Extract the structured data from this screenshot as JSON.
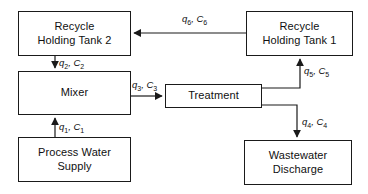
{
  "diagram": {
    "type": "block-flow-diagram",
    "colors": {
      "stroke": "#1a1a1a",
      "text": "#101010",
      "background": "#ffffff"
    },
    "nodes": [
      {
        "id": "recycle-holding-tank-2",
        "label": "Recycle\nHolding Tank 2",
        "x": 18,
        "y": 11,
        "w": 113,
        "h": 45
      },
      {
        "id": "recycle-holding-tank-1",
        "label": "Recycle\nHolding Tank 1",
        "x": 246,
        "y": 11,
        "w": 107,
        "h": 45
      },
      {
        "id": "mixer",
        "label": "Mixer",
        "x": 18,
        "y": 71,
        "w": 113,
        "h": 44
      },
      {
        "id": "treatment",
        "label": "Treatment",
        "x": 165,
        "y": 84,
        "w": 97,
        "h": 24
      },
      {
        "id": "process-water-supply",
        "label": "Process Water\nSupply",
        "x": 18,
        "y": 137,
        "w": 113,
        "h": 45
      },
      {
        "id": "wastewater-discharge",
        "label": "Wastewater\nDischarge",
        "x": 244,
        "y": 140,
        "w": 108,
        "h": 45
      }
    ],
    "edges": [
      {
        "id": "edge-q6",
        "from": "recycle-holding-tank-1",
        "to": "recycle-holding-tank-2",
        "flow": "q",
        "flow_index": "6",
        "conc": "C",
        "conc_index": "6",
        "label": "q6, C6",
        "label_x": 182,
        "label_y": 14
      },
      {
        "id": "edge-q2",
        "from": "recycle-holding-tank-2",
        "to": "mixer",
        "flow": "q",
        "flow_index": "2",
        "conc": "C",
        "conc_index": "2",
        "label": "q2, C2",
        "label_x": 59,
        "label_y": 58
      },
      {
        "id": "edge-q3",
        "from": "mixer",
        "to": "treatment",
        "flow": "q",
        "flow_index": "3",
        "conc": "C",
        "conc_index": "3",
        "label": "q3, C3",
        "label_x": 132,
        "label_y": 80
      },
      {
        "id": "edge-q5",
        "from": "treatment",
        "to": "recycle-holding-tank-1",
        "flow": "q",
        "flow_index": "5",
        "conc": "C",
        "conc_index": "5",
        "label": "q5, C5",
        "label_x": 304,
        "label_y": 66
      },
      {
        "id": "edge-q4",
        "from": "treatment",
        "to": "wastewater-discharge",
        "flow": "q",
        "flow_index": "4",
        "conc": "C",
        "conc_index": "4",
        "label": "q4, C4",
        "label_x": 302,
        "label_y": 117
      },
      {
        "id": "edge-q1",
        "from": "process-water-supply",
        "to": "mixer",
        "flow": "q",
        "flow_index": "1",
        "conc": "C",
        "conc_index": "1",
        "label": "q1, C1",
        "label_x": 59,
        "label_y": 122
      }
    ]
  }
}
